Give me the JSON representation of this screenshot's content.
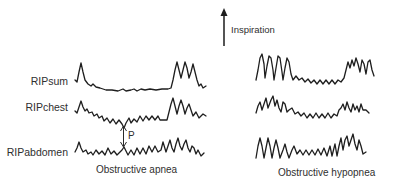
{
  "figure": {
    "type": "respiratory inductance plethysmography traces",
    "direction_indicator": {
      "label": "Inspiration",
      "icon": "up-arrow-icon"
    },
    "row_labels": [
      "RIPsum",
      "RIPchest",
      "RIPabdomen"
    ],
    "panels": [
      {
        "caption": "Obstructive apnea",
        "annotation": "P"
      },
      {
        "caption": "Obstructive hypopnea"
      }
    ]
  }
}
